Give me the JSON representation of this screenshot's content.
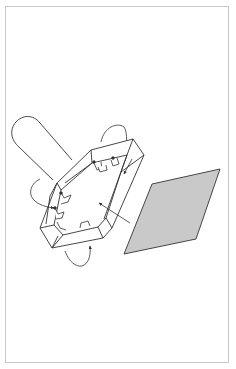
{
  "figure": {
    "colors": {
      "line": "#333333",
      "plate_fill": "#c9c9c9",
      "frame_border": "#c8c8c8",
      "background": "#ffffff"
    },
    "elements": {
      "cylinder": "cylinder",
      "square_frame": "square-frame",
      "plate": "gray-plate",
      "rotation_arrows": [
        "rotation-arrow-top",
        "rotation-arrow-left",
        "rotation-arrow-bottom"
      ],
      "pointer_arrows": [
        "pointer-arrow-plate",
        "pointer-arrow-right-side"
      ]
    }
  }
}
